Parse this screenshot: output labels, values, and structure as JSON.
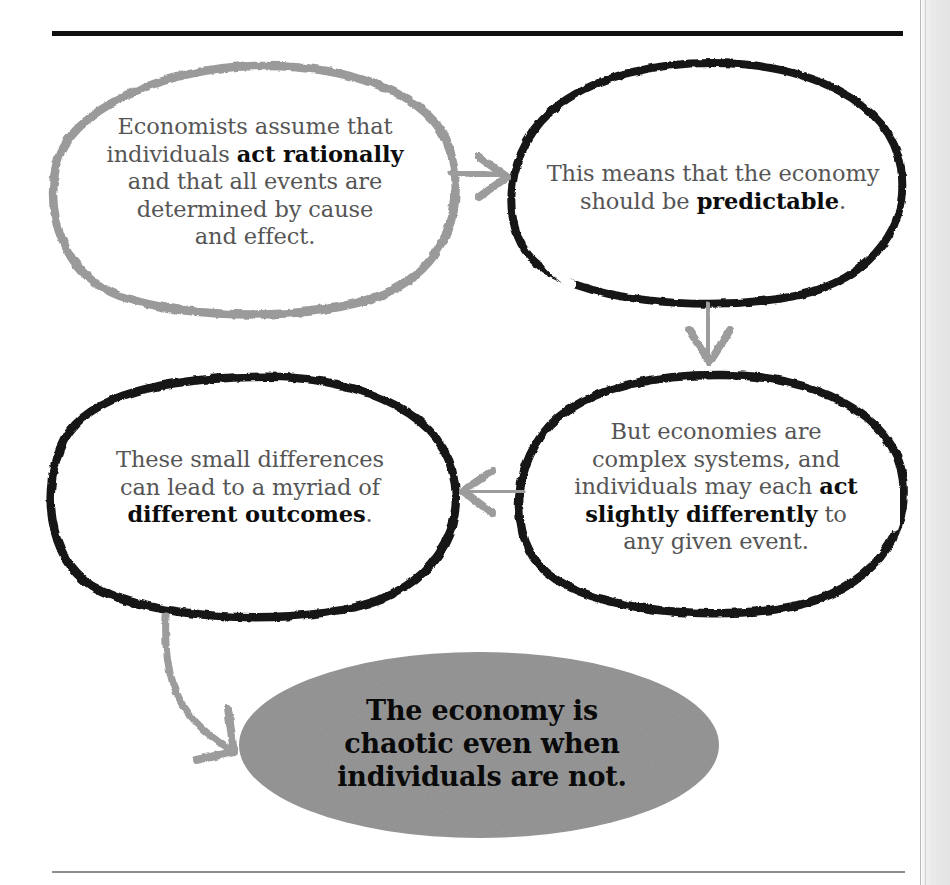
{
  "page": {
    "clipped_header_fragment": "g",
    "background_color": "#ffffff",
    "rule_top_color": "#111111",
    "rule_bottom_color": "#8d8d8d"
  },
  "diagram": {
    "type": "flowchart",
    "ink_colors": {
      "gray_outline": "#9a9a9a",
      "black_outline": "#141414",
      "arrow_gray": "#9c9c9c",
      "fill_gray": "#909090",
      "body_text": "#555555",
      "bold_text": "#0d0d0d"
    },
    "nodes": [
      {
        "id": "node-1",
        "shape": "hand-drawn-ellipse",
        "outline": "gray",
        "fill": "none",
        "text_plain": "Economists assume that individuals act rationally and that all events are determined by cause and effect.",
        "text_html": "Economists assume that<br>individuals <b>act rationally</b><br>and that all events are<br>determined by cause<br>and effect."
      },
      {
        "id": "node-2",
        "shape": "hand-drawn-ellipse",
        "outline": "black",
        "fill": "none",
        "text_plain": "This means that the economy should be predictable.",
        "text_html": "This means that the economy<br>should be <b>predictable</b>."
      },
      {
        "id": "node-3",
        "shape": "hand-drawn-ellipse",
        "outline": "black",
        "fill": "none",
        "text_plain": "But economies are complex systems, and individuals may each act slightly differently to any given event.",
        "text_html": "But economies are<br>complex systems, and<br>individuals may each <b>act</b><br><b>slightly differently</b> to<br>any given event."
      },
      {
        "id": "node-4",
        "shape": "hand-drawn-ellipse",
        "outline": "black",
        "fill": "none",
        "text_plain": "These small differences can lead to a myriad of different outcomes.",
        "text_html": "These small differences<br>can lead to a myriad of<br><b>different outcomes</b>."
      },
      {
        "id": "node-5",
        "shape": "filled-ellipse",
        "outline": "none",
        "fill": "#909090",
        "text_plain": "The economy is chaotic even when individuals are not.",
        "text_html": "The economy is<br>chaotic even when<br>individuals are not."
      }
    ],
    "arrows": [
      {
        "id": "arrow-1",
        "from": "node-1",
        "to": "node-2",
        "direction": "right",
        "color": "#9c9c9c",
        "style": "straight"
      },
      {
        "id": "arrow-2",
        "from": "node-2",
        "to": "node-3",
        "direction": "down",
        "color": "#9c9c9c",
        "style": "straight"
      },
      {
        "id": "arrow-3",
        "from": "node-3",
        "to": "node-4",
        "direction": "left",
        "color": "#9c9c9c",
        "style": "straight"
      },
      {
        "id": "arrow-4",
        "from": "node-4",
        "to": "node-5",
        "direction": "down-right",
        "color": "#9c9c9c",
        "style": "curved"
      }
    ]
  }
}
